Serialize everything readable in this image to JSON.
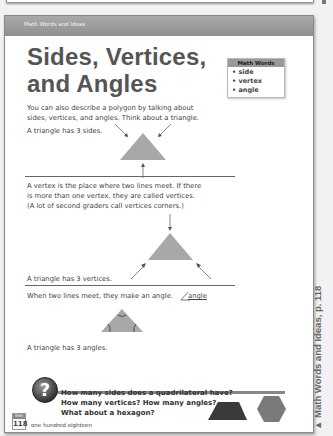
{
  "header": {
    "section_label": "Math Words and Ideas"
  },
  "title": {
    "line1": "Sides, Vertices,",
    "line2": "and Angles"
  },
  "math_words": {
    "heading": "Math Words",
    "items": [
      "• side",
      "• vertex",
      "• angle"
    ]
  },
  "sections": {
    "intro": {
      "line1": "You can also describe a polygon by talking about",
      "line2": "sides, vertices, and angles. Think about a triangle."
    },
    "sides": {
      "caption": "A triangle has 3 sides."
    },
    "vertices": {
      "line1": "A vertex is the place where two lines meet. If there",
      "line2": "is more than one vertex, they are called vertices.",
      "line3": "(A lot of second graders call vertices corners.)",
      "caption": "A triangle has 3 vertices."
    },
    "angles": {
      "intro": "When two lines meet, they make an angle.",
      "angle_label": "angle",
      "caption": "A triangle has 3 angles."
    }
  },
  "question": {
    "icon": "question-mark-icon",
    "line1": "How many sides does a quadrilateral have?",
    "line2": "How many vertices? How many angles?",
    "line3": "What about a hexagon?"
  },
  "footer": {
    "badge_top": "SMH",
    "page_number": "118",
    "page_words": "one hundred eighteen"
  },
  "side_caption": "▲  Math Words and Ideas, p. 118",
  "colors": {
    "shape_fill": "#a8a8a8",
    "trapezoid_fill": "#3a3a3a",
    "hexagon_fill": "#7a7a7a",
    "header_bar": "#9a9a9a"
  }
}
